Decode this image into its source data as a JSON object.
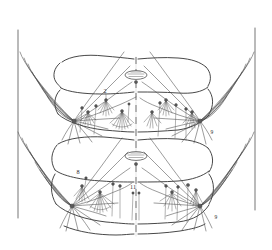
{
  "figure": {
    "background_color": "#ffffff",
    "ink_color": "#3a3a3a",
    "width": 272,
    "height": 250,
    "orientation": "bilateral, dashed mid-dorsal line"
  },
  "labels": [
    {
      "id": "seta-2-upper-left",
      "text": "2",
      "x": 105,
      "y": 93
    },
    {
      "id": "seta-9-upper-right",
      "text": "9",
      "x": 212,
      "y": 134
    },
    {
      "id": "seta-8-lower-left",
      "text": "8",
      "x": 78,
      "y": 174
    },
    {
      "id": "seta-11-midline",
      "text": "11",
      "x": 131,
      "y": 189
    },
    {
      "id": "seta-9-lower-right",
      "text": "9",
      "x": 216,
      "y": 219
    }
  ],
  "structures": {
    "midline": {
      "name": "mid-dorsal dashed line",
      "x": 136
    },
    "left_margin_rule": {
      "name": "left lateral rule",
      "x": 18
    },
    "right_margin_rule": {
      "name": "right lateral rule",
      "x": 255
    },
    "segments": [
      {
        "name": "segment-upper",
        "top": 58,
        "bottom": 140
      },
      {
        "name": "segment-lower",
        "top": 140,
        "bottom": 232
      }
    ],
    "spiracles": [
      {
        "name": "spiracle-upper",
        "cx": 136,
        "cy": 75
      },
      {
        "name": "spiracle-lower",
        "cx": 136,
        "cy": 156
      }
    ]
  },
  "seta_groups": [
    {
      "name": "palmate-seta-upper-left",
      "origin_x": 72,
      "origin_y": 120,
      "rays": 18
    },
    {
      "name": "palmate-seta-upper-right",
      "origin_x": 200,
      "origin_y": 120,
      "rays": 18
    },
    {
      "name": "palmate-seta-lower-left",
      "origin_x": 72,
      "origin_y": 205,
      "rays": 18
    },
    {
      "name": "palmate-seta-lower-right",
      "origin_x": 200,
      "origin_y": 205,
      "rays": 18
    },
    {
      "name": "tufted-seta-upper-left",
      "origin_x": 106,
      "origin_y": 100,
      "rays": 9
    },
    {
      "name": "tufted-seta-upper-right",
      "origin_x": 166,
      "origin_y": 100,
      "rays": 9
    },
    {
      "name": "tufted-seta-lower-left",
      "origin_x": 100,
      "origin_y": 192,
      "rays": 9
    },
    {
      "name": "tufted-seta-lower-right",
      "origin_x": 172,
      "origin_y": 192,
      "rays": 9
    }
  ]
}
